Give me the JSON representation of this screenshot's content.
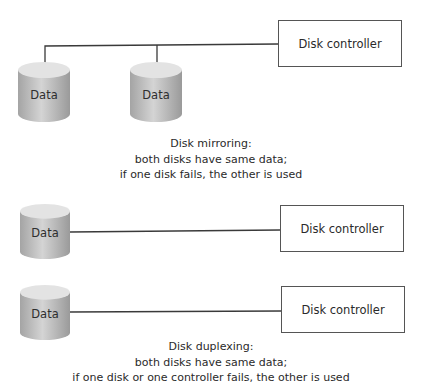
{
  "mirroring": {
    "disks": [
      {
        "label": "Data"
      },
      {
        "label": "Data"
      }
    ],
    "controller": {
      "label": "Disk controller"
    },
    "caption": {
      "title": "Disk mirroring:",
      "line1": "both disks have same data;",
      "line2": "if one disk fails, the other is used"
    }
  },
  "duplexing": {
    "pairs": [
      {
        "disk_label": "Data",
        "controller_label": "Disk controller"
      },
      {
        "disk_label": "Data",
        "controller_label": "Disk controller"
      }
    ],
    "caption": {
      "title": "Disk duplexing:",
      "line1": "both disks have same data;",
      "line2": "if one disk or one controller fails, the other is used"
    }
  },
  "colors": {
    "line": "#3a3a3a",
    "disk_body_light": "#d2d2d2",
    "disk_body_dark": "#9c9c9c",
    "disk_top": "#e4e4e4",
    "border": "#555555"
  }
}
